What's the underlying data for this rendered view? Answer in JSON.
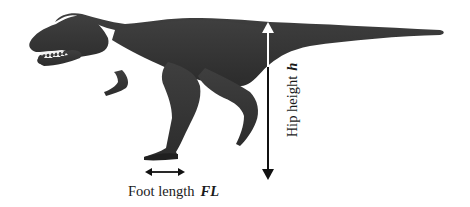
{
  "figure": {
    "colors": {
      "body": "#3a3a3a",
      "body_shade": "#2a2a2a",
      "teeth": "#f0f0f0",
      "arrow_dark": "#111111",
      "arrow_light": "#ffffff",
      "background": "#ffffff"
    },
    "annotations": {
      "foot_length": {
        "text": "Foot length",
        "symbol": "FL",
        "arrow": "double-headed horizontal arrow under foot"
      },
      "hip_height": {
        "text": "Hip height",
        "symbol": "h",
        "arrow": "double-headed vertical arrow from hip to ground"
      }
    }
  }
}
